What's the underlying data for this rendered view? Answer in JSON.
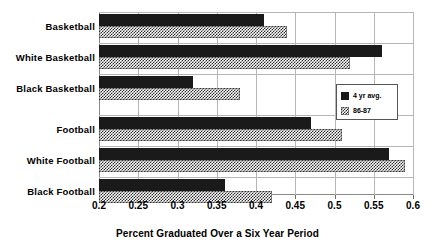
{
  "chart_data": {
    "type": "bar",
    "orientation": "horizontal",
    "title": "",
    "xlabel": "Percent Graduated Over a Six Year Period",
    "ylabel": "",
    "xlim": [
      0.2,
      0.6
    ],
    "xticks": [
      "0.2",
      "0.25",
      "0.3",
      "0.35",
      "0.4",
      "0.45",
      "0.5",
      "0.55",
      "0.6"
    ],
    "xtick_values": [
      0.2,
      0.25,
      0.3,
      0.35,
      0.4,
      0.45,
      0.5,
      0.55,
      0.6
    ],
    "grid": true,
    "grid_axis": "x",
    "legend_position": "center-right",
    "categories": [
      "Basketball",
      "White Basketball",
      "Black Basketball",
      "Football",
      "White Football",
      "Black Football"
    ],
    "series": [
      {
        "name": "4 yr avg.",
        "color": "#1a1a1a",
        "fill": "solid",
        "values": [
          0.41,
          0.56,
          0.32,
          0.47,
          0.57,
          0.36
        ]
      },
      {
        "name": "86-87",
        "color": "#2b2b2b",
        "fill": "checkered",
        "values": [
          0.44,
          0.52,
          0.38,
          0.51,
          0.59,
          0.42
        ]
      }
    ]
  },
  "legend": {
    "entries": [
      {
        "label": "4 yr avg."
      },
      {
        "label": "86-87"
      }
    ]
  },
  "axis": {
    "x_title": "Percent Graduated Over a Six Year Period"
  },
  "colors": {
    "background": "#ffffff",
    "axis": "#8a8a8a",
    "grid": "#b6b6b6",
    "series_solid": "#1a1a1a",
    "series_hatch": "#2b2b2b",
    "text": "#000000"
  }
}
